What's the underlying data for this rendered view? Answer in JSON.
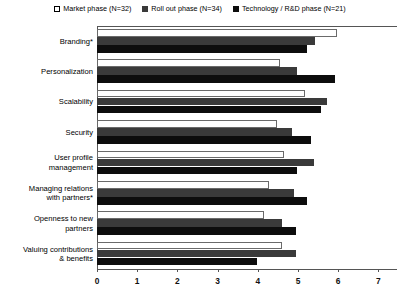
{
  "legend": {
    "items": [
      {
        "label": "Market phase (N=32)",
        "swatch": "white-square-icon",
        "color": "#ffffff"
      },
      {
        "label": "Roll out phase (N=34)",
        "swatch": "gray-square-icon",
        "color": "#3a3a3a"
      },
      {
        "label": "Technology / R&D phase (N=21)",
        "swatch": "black-square-icon",
        "color": "#0d0d0d"
      }
    ]
  },
  "chart_data": {
    "type": "bar",
    "orientation": "horizontal",
    "title": "",
    "xlabel": "",
    "ylabel": "",
    "xlim": [
      0,
      7
    ],
    "xticks": [
      0,
      1,
      2,
      3,
      4,
      5,
      6,
      7
    ],
    "grid": false,
    "legend_position": "top-center",
    "categories": [
      "Branding*",
      "Personalization",
      "Scalability",
      "Security",
      "User profile management",
      "Managing relations with partners*",
      "Openness to new partners",
      "Valuing contributions & benefits"
    ],
    "category_lines": [
      [
        "Branding*"
      ],
      [
        "Personalization"
      ],
      [
        "Scalability"
      ],
      [
        "Security"
      ],
      [
        "User profile",
        "management"
      ],
      [
        "Managing relations",
        "with partners*"
      ],
      [
        "Openness to new",
        "partners"
      ],
      [
        "Valuing contributions",
        "& benefits"
      ]
    ],
    "series": [
      {
        "name": "Market phase (N=32)",
        "color": "#ffffff",
        "values": [
          5.97,
          4.55,
          5.17,
          4.48,
          4.65,
          4.28,
          4.15,
          4.6
        ]
      },
      {
        "name": "Roll out phase (N=34)",
        "color": "#3a3a3a",
        "values": [
          5.42,
          4.98,
          5.72,
          4.85,
          5.4,
          4.9,
          4.6,
          4.95
        ]
      },
      {
        "name": "Technology / R&D phase (N=21)",
        "color": "#0d0d0d",
        "values": [
          5.22,
          5.92,
          5.57,
          5.32,
          4.98,
          5.22,
          4.95,
          3.98
        ]
      }
    ]
  }
}
